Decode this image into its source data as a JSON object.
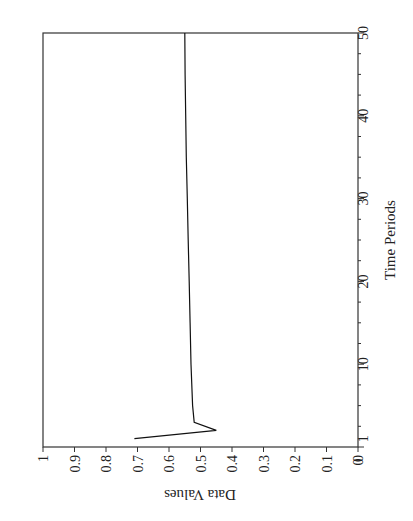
{
  "chart_data": {
    "type": "line",
    "orientation": "rotated-90-clockwise",
    "title": "",
    "xlabel": "Time Periods",
    "ylabel": "Data Values",
    "xlim": [
      0,
      50
    ],
    "ylim": [
      0,
      1
    ],
    "grid": false,
    "legend": null,
    "x_ticks": [
      "1",
      "10",
      "20",
      "30",
      "40",
      "50"
    ],
    "x_tick_values": [
      1,
      10,
      20,
      30,
      40,
      50
    ],
    "y_ticks": [
      "0",
      "0.1",
      "0.2",
      "0.3",
      "0.4",
      "0.5",
      "0.6",
      "0.7",
      "0.8",
      "0.9",
      "1"
    ],
    "y_tick_values": [
      0,
      0.1,
      0.2,
      0.3,
      0.4,
      0.5,
      0.6,
      0.7,
      0.8,
      0.9,
      1
    ],
    "series": [
      {
        "name": "Data Values",
        "color": "#000000",
        "x": [
          1,
          2,
          3,
          5,
          10,
          15,
          20,
          25,
          30,
          35,
          40,
          45,
          50
        ],
        "values": [
          0.71,
          0.45,
          0.52,
          0.525,
          0.53,
          0.533,
          0.536,
          0.539,
          0.542,
          0.545,
          0.547,
          0.549,
          0.55
        ]
      }
    ]
  },
  "labels": {
    "xlabel": "Time Periods",
    "ylabel": "Data Values"
  }
}
